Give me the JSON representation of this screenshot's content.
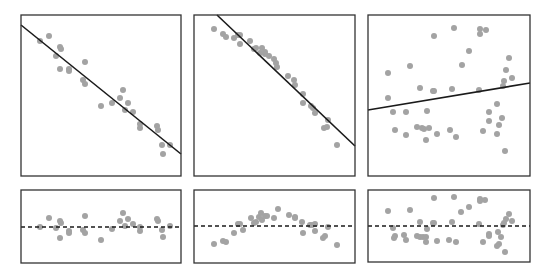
{
  "colors": {
    "background": "#ffffff",
    "frame": "#333333",
    "fit_line": "#1a1a1a",
    "points": "#a3a3a3"
  },
  "layout": {
    "panels_top": [
      {
        "x0": 21,
        "y0": 15,
        "x1": 181,
        "y1": 176
      },
      {
        "x0": 194,
        "y0": 15,
        "x1": 355,
        "y1": 176
      },
      {
        "x0": 368,
        "y0": 15,
        "x1": 530,
        "y1": 176
      }
    ],
    "panels_bottom": [
      {
        "x0": 21,
        "y0": 190,
        "x1": 181,
        "y1": 263
      },
      {
        "x0": 194,
        "y0": 190,
        "x1": 355,
        "y1": 263
      },
      {
        "x0": 368,
        "y0": 190,
        "x1": 530,
        "y1": 262
      }
    ]
  },
  "chart_data": [
    {
      "type": "scatter",
      "title": "",
      "xlabel": "",
      "ylabel": "",
      "grid": false,
      "description": "Top-left: strong negative linear relationship with fitted regression line",
      "fit_line": {
        "x1": 21,
        "y1": 25,
        "x2": 181,
        "y2": 154
      },
      "points": [
        [
          49,
          36
        ],
        [
          40,
          41
        ],
        [
          60,
          47
        ],
        [
          61,
          49
        ],
        [
          56,
          56
        ],
        [
          60,
          69
        ],
        [
          69,
          69
        ],
        [
          69,
          71
        ],
        [
          85,
          62
        ],
        [
          83,
          80
        ],
        [
          85,
          84
        ],
        [
          101,
          106
        ],
        [
          112,
          103
        ],
        [
          120,
          98
        ],
        [
          123,
          90
        ],
        [
          128,
          103
        ],
        [
          125,
          110
        ],
        [
          133,
          112
        ],
        [
          140,
          124
        ],
        [
          140,
          128
        ],
        [
          157,
          126
        ],
        [
          158,
          130
        ],
        [
          162,
          145
        ],
        [
          170,
          145
        ],
        [
          163,
          154
        ]
      ]
    },
    {
      "type": "scatter",
      "title": "",
      "xlabel": "",
      "ylabel": "",
      "grid": false,
      "description": "Top-middle: negative relationship with slight curvature, fitted regression line",
      "fit_line": {
        "x1": 217,
        "y1": 15,
        "x2": 355,
        "y2": 146
      },
      "points": [
        [
          214,
          29
        ],
        [
          223,
          34
        ],
        [
          226,
          37
        ],
        [
          234,
          38
        ],
        [
          238,
          35
        ],
        [
          240,
          44
        ],
        [
          240,
          35
        ],
        [
          250,
          41
        ],
        [
          254,
          49
        ],
        [
          256,
          48
        ],
        [
          260,
          53
        ],
        [
          262,
          48
        ],
        [
          265,
          54
        ],
        [
          265,
          52
        ],
        [
          269,
          56
        ],
        [
          274,
          59
        ],
        [
          277,
          67
        ],
        [
          276,
          63
        ],
        [
          288,
          76
        ],
        [
          294,
          80
        ],
        [
          295,
          85
        ],
        [
          303,
          94
        ],
        [
          303,
          103
        ],
        [
          311,
          106
        ],
        [
          313,
          108
        ],
        [
          315,
          113
        ],
        [
          324,
          128
        ],
        [
          327,
          127
        ],
        [
          328,
          120
        ],
        [
          337,
          145
        ]
      ]
    },
    {
      "type": "scatter",
      "title": "",
      "xlabel": "",
      "ylabel": "",
      "grid": false,
      "description": "Top-right: no clear relationship, nearly flat fitted line",
      "fit_line": {
        "x1": 368,
        "y1": 110,
        "x2": 530,
        "y2": 83
      },
      "points": [
        [
          434,
          36
        ],
        [
          454,
          28
        ],
        [
          480,
          29
        ],
        [
          486,
          30
        ],
        [
          480,
          34
        ],
        [
          469,
          51
        ],
        [
          388,
          73
        ],
        [
          410,
          66
        ],
        [
          462,
          65
        ],
        [
          509,
          58
        ],
        [
          506,
          70
        ],
        [
          504,
          81
        ],
        [
          512,
          78
        ],
        [
          388,
          98
        ],
        [
          420,
          88
        ],
        [
          433,
          91
        ],
        [
          434,
          91
        ],
        [
          452,
          89
        ],
        [
          479,
          90
        ],
        [
          503,
          86
        ],
        [
          406,
          112
        ],
        [
          393,
          112
        ],
        [
          427,
          111
        ],
        [
          497,
          104
        ],
        [
          489,
          112
        ],
        [
          489,
          121
        ],
        [
          502,
          118
        ],
        [
          499,
          125
        ],
        [
          395,
          130
        ],
        [
          406,
          135
        ],
        [
          417,
          127
        ],
        [
          422,
          128
        ],
        [
          424,
          129
        ],
        [
          429,
          128
        ],
        [
          426,
          140
        ],
        [
          437,
          134
        ],
        [
          450,
          130
        ],
        [
          456,
          137
        ],
        [
          483,
          131
        ],
        [
          497,
          134
        ],
        [
          505,
          151
        ]
      ]
    },
    {
      "type": "scatter",
      "title": "",
      "description": "Bottom-left: residuals randomly scattered around zero",
      "zero_line_y": 227,
      "points": [
        [
          40,
          227
        ],
        [
          49,
          218
        ],
        [
          56,
          228
        ],
        [
          60,
          221
        ],
        [
          61,
          223
        ],
        [
          60,
          238
        ],
        [
          69,
          231
        ],
        [
          69,
          233
        ],
        [
          85,
          216
        ],
        [
          83,
          230
        ],
        [
          85,
          233
        ],
        [
          101,
          240
        ],
        [
          112,
          229
        ],
        [
          120,
          221
        ],
        [
          123,
          213
        ],
        [
          128,
          219
        ],
        [
          125,
          226
        ],
        [
          133,
          224
        ],
        [
          140,
          231
        ],
        [
          140,
          227
        ],
        [
          157,
          219
        ],
        [
          158,
          221
        ],
        [
          162,
          230
        ],
        [
          170,
          226
        ],
        [
          163,
          237
        ]
      ]
    },
    {
      "type": "scatter",
      "title": "",
      "description": "Bottom-middle: residuals with arched (curved) pattern",
      "zero_line_y": 226,
      "points": [
        [
          214,
          244
        ],
        [
          223,
          241
        ],
        [
          226,
          242
        ],
        [
          234,
          233
        ],
        [
          238,
          224
        ],
        [
          240,
          224
        ],
        [
          243,
          230
        ],
        [
          251,
          218
        ],
        [
          254,
          223
        ],
        [
          256,
          222
        ],
        [
          259,
          217
        ],
        [
          261,
          213
        ],
        [
          262,
          220
        ],
        [
          265,
          216
        ],
        [
          267,
          216
        ],
        [
          274,
          218
        ],
        [
          278,
          209
        ],
        [
          289,
          215
        ],
        [
          295,
          217
        ],
        [
          295,
          218
        ],
        [
          302,
          222
        ],
        [
          303,
          233
        ],
        [
          310,
          225
        ],
        [
          312,
          225
        ],
        [
          315,
          224
        ],
        [
          315,
          231
        ],
        [
          323,
          238
        ],
        [
          325,
          236
        ],
        [
          328,
          227
        ],
        [
          337,
          245
        ]
      ]
    },
    {
      "type": "scatter",
      "title": "",
      "description": "Bottom-right: residuals widely scattered around zero",
      "zero_line_y": 226,
      "points": [
        [
          434,
          198
        ],
        [
          454,
          197
        ],
        [
          480,
          199
        ],
        [
          485,
          200
        ],
        [
          480,
          201
        ],
        [
          469,
          207
        ],
        [
          388,
          211
        ],
        [
          410,
          210
        ],
        [
          461,
          212
        ],
        [
          509,
          214
        ],
        [
          506,
          219
        ],
        [
          504,
          223
        ],
        [
          512,
          221
        ],
        [
          393,
          228
        ],
        [
          420,
          222
        ],
        [
          433,
          223
        ],
        [
          434,
          223
        ],
        [
          452,
          222
        ],
        [
          479,
          224
        ],
        [
          503,
          225
        ],
        [
          404,
          235
        ],
        [
          395,
          236
        ],
        [
          427,
          229
        ],
        [
          498,
          232
        ],
        [
          489,
          234
        ],
        [
          489,
          236
        ],
        [
          501,
          237
        ],
        [
          499,
          244
        ],
        [
          394,
          238
        ],
        [
          406,
          240
        ],
        [
          417,
          236
        ],
        [
          420,
          237
        ],
        [
          423,
          237
        ],
        [
          426,
          237
        ],
        [
          426,
          242
        ],
        [
          437,
          241
        ],
        [
          449,
          240
        ],
        [
          456,
          242
        ],
        [
          483,
          242
        ],
        [
          497,
          246
        ],
        [
          505,
          252
        ]
      ]
    }
  ]
}
